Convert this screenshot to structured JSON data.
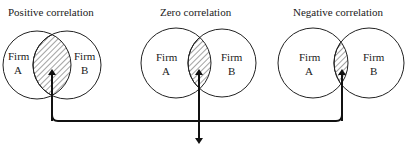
{
  "panels": [
    {
      "title": "Positive correlation",
      "firm_a": {
        "line1": "Firm",
        "line2": "A"
      },
      "firm_b": {
        "line1": "Firm",
        "line2": "B"
      },
      "overlap": "large"
    },
    {
      "title": "Zero correlation",
      "firm_a": {
        "line1": "Firm",
        "line2": "A"
      },
      "firm_b": {
        "line1": "Firm",
        "line2": "B"
      },
      "overlap": "medium"
    },
    {
      "title": "Negative correlation",
      "firm_a": {
        "line1": "Firm",
        "line2": "A"
      },
      "firm_b": {
        "line1": "Firm",
        "line2": "B"
      },
      "overlap": "small"
    }
  ],
  "colors": {
    "stroke": "#222222",
    "background": "#ffffff"
  }
}
